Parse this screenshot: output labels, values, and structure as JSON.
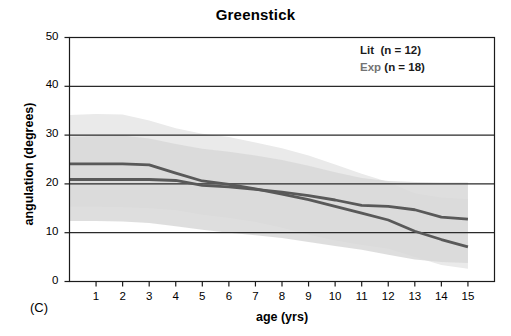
{
  "figure": {
    "panel_label": "(C)",
    "title": "Greenstick"
  },
  "axes": {
    "xlabel": "age (yrs)",
    "ylabel": "angulation (degrees)",
    "xticks": [
      1,
      2,
      3,
      4,
      5,
      6,
      7,
      8,
      9,
      10,
      11,
      12,
      13,
      14,
      15
    ],
    "yticks": [
      0,
      10,
      20,
      30,
      40,
      50
    ],
    "xlim": [
      0,
      16
    ],
    "ylim": [
      0,
      50
    ],
    "grid": "horizontal"
  },
  "legend": {
    "position": "top-right",
    "entries": [
      {
        "key": "Lit",
        "detail": "(n = 12)",
        "n": 12,
        "color": "#1b1b1b"
      },
      {
        "key": "Exp",
        "detail": "(n = 18)",
        "n": 18,
        "color": "#737373"
      }
    ]
  },
  "colors": {
    "line_lit": "#595959",
    "line_exp": "#595959",
    "band_lit": "#d8d8d8",
    "band_exp": "#eaeaea",
    "axis": "#1b1b1b",
    "grid": "#2a2a2a"
  },
  "chart_data": {
    "type": "line",
    "title": "Greenstick",
    "xlabel": "age (yrs)",
    "ylabel": "angulation (degrees)",
    "xlim": [
      0,
      16
    ],
    "ylim": [
      0,
      50
    ],
    "grid": true,
    "legend_position": "top right",
    "x": [
      0,
      1,
      2,
      3,
      4,
      5,
      6,
      7,
      8,
      9,
      10,
      11,
      12,
      13,
      14,
      15
    ],
    "series": [
      {
        "name": "Lit",
        "label": "Lit  (n = 12)",
        "n": 12,
        "color": "#595959",
        "values": [
          20.9,
          20.9,
          20.9,
          20.9,
          20.7,
          19.7,
          19.4,
          18.9,
          18.3,
          17.6,
          16.7,
          15.6,
          15.4,
          14.7,
          13.2,
          12.8
        ],
        "band": {
          "name": "Lit range",
          "color": "#d8d8d8",
          "upper": [
            29.6,
            29.8,
            29.9,
            29.3,
            28.2,
            27.2,
            26.6,
            25.8,
            24.9,
            23.7,
            22.4,
            21.2,
            20.6,
            20.4,
            20.3,
            20.3
          ],
          "lower": [
            12.4,
            12.4,
            12.3,
            12.0,
            11.3,
            10.6,
            10.0,
            9.5,
            8.9,
            8.1,
            7.3,
            6.5,
            5.5,
            4.5,
            4.0,
            3.8
          ]
        }
      },
      {
        "name": "Exp",
        "label": "Exp (n = 18)",
        "n": 18,
        "color": "#595959",
        "values": [
          24.1,
          24.1,
          24.1,
          23.9,
          22.2,
          20.6,
          19.9,
          19.0,
          17.9,
          16.8,
          15.4,
          14.0,
          12.6,
          10.3,
          8.6,
          7.1
        ],
        "band": {
          "name": "Exp range",
          "color": "#eaeaea",
          "upper": [
            34.1,
            34.3,
            34.2,
            33.0,
            31.4,
            30.3,
            29.6,
            28.5,
            27.3,
            25.8,
            24.0,
            22.1,
            20.4,
            18.1,
            17.2,
            16.9
          ],
          "lower": [
            15.3,
            15.3,
            15.2,
            15.0,
            14.6,
            13.7,
            13.0,
            12.2,
            11.0,
            9.6,
            8.4,
            7.5,
            6.7,
            5.0,
            3.4,
            2.6
          ]
        }
      }
    ]
  }
}
